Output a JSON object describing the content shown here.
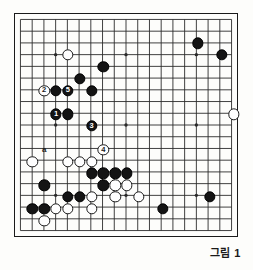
{
  "figure": {
    "caption": "그림 1",
    "type": "go-board-diagram"
  },
  "board": {
    "size": 19,
    "cols_visible": 19,
    "rows_visible": 19,
    "line_color": "#2a2a2a",
    "border_color": "#1a1a1a",
    "background_color": "#fdfdfb",
    "star_points": [
      {
        "col": 3,
        "row": 3
      },
      {
        "col": 9,
        "row": 3
      },
      {
        "col": 15,
        "row": 3
      },
      {
        "col": 3,
        "row": 9
      },
      {
        "col": 9,
        "row": 9
      },
      {
        "col": 15,
        "row": 9
      },
      {
        "col": 3,
        "row": 15
      },
      {
        "col": 9,
        "row": 15
      },
      {
        "col": 15,
        "row": 15
      }
    ]
  },
  "stones": {
    "black": [
      {
        "col": 15,
        "row": 2
      },
      {
        "col": 17,
        "row": 3
      },
      {
        "col": 4,
        "row": 8
      },
      {
        "col": 3,
        "row": 6
      },
      {
        "col": 6,
        "row": 6
      },
      {
        "col": 5,
        "row": 5
      },
      {
        "col": 7,
        "row": 4
      },
      {
        "col": 6,
        "row": 13
      },
      {
        "col": 7,
        "row": 13
      },
      {
        "col": 8,
        "row": 13
      },
      {
        "col": 9,
        "row": 13
      },
      {
        "col": 2,
        "row": 14
      },
      {
        "col": 7,
        "row": 14
      },
      {
        "col": 4,
        "row": 15
      },
      {
        "col": 5,
        "row": 15
      },
      {
        "col": 1,
        "row": 16
      },
      {
        "col": 2,
        "row": 16
      },
      {
        "col": 12,
        "row": 16
      },
      {
        "col": 16,
        "row": 15
      }
    ],
    "white": [
      {
        "col": 4,
        "row": 3
      },
      {
        "col": 18,
        "row": 8
      },
      {
        "col": 1,
        "row": 12
      },
      {
        "col": 4,
        "row": 12
      },
      {
        "col": 5,
        "row": 12
      },
      {
        "col": 6,
        "row": 12
      },
      {
        "col": 8,
        "row": 14
      },
      {
        "col": 9,
        "row": 14
      },
      {
        "col": 6,
        "row": 15
      },
      {
        "col": 8,
        "row": 15
      },
      {
        "col": 10,
        "row": 15
      },
      {
        "col": 3,
        "row": 16
      },
      {
        "col": 4,
        "row": 16
      },
      {
        "col": 6,
        "row": 16
      },
      {
        "col": 2,
        "row": 17
      }
    ]
  },
  "numbered_moves": [
    {
      "label": "1",
      "color": "black",
      "col": 3,
      "row": 8
    },
    {
      "label": "2",
      "color": "white",
      "col": 2,
      "row": 6
    },
    {
      "label": "3",
      "color": "black",
      "col": 6,
      "row": 9
    },
    {
      "label": "4",
      "color": "white",
      "col": 7,
      "row": 11
    },
    {
      "label": "5",
      "color": "black",
      "col": 4,
      "row": 6
    }
  ],
  "markers": [
    {
      "label": "a",
      "col": 2,
      "row": 11
    }
  ]
}
